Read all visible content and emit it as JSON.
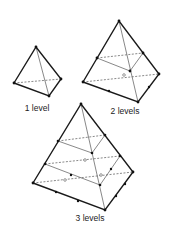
{
  "diagram": {
    "colors": {
      "edge": "#1a1a1a",
      "inner": "#555555",
      "background": "#ffffff"
    },
    "panels": [
      {
        "id": "level-1",
        "label": "1 level"
      },
      {
        "id": "level-2",
        "label": "2 levels"
      },
      {
        "id": "level-3",
        "label": "3 levels"
      }
    ]
  }
}
